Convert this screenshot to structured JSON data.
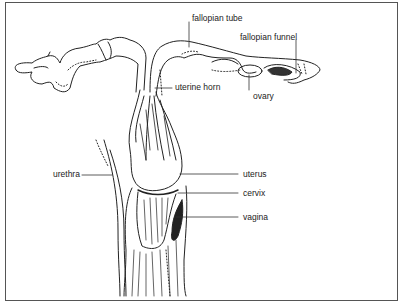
{
  "diagram": {
    "type": "anatomical illustration",
    "labels": {
      "fallopian_tube": "fallopian tube",
      "fallopian_funnel": "fallopian funnel",
      "uterine_horn": "uterine horn",
      "ovary": "ovary",
      "urethra": "urethra",
      "uterus": "uterus",
      "cervix": "cervix",
      "vagina": "vagina"
    },
    "colors": {
      "line": "#222222",
      "frame": "#555555",
      "background": "#ffffff"
    }
  }
}
